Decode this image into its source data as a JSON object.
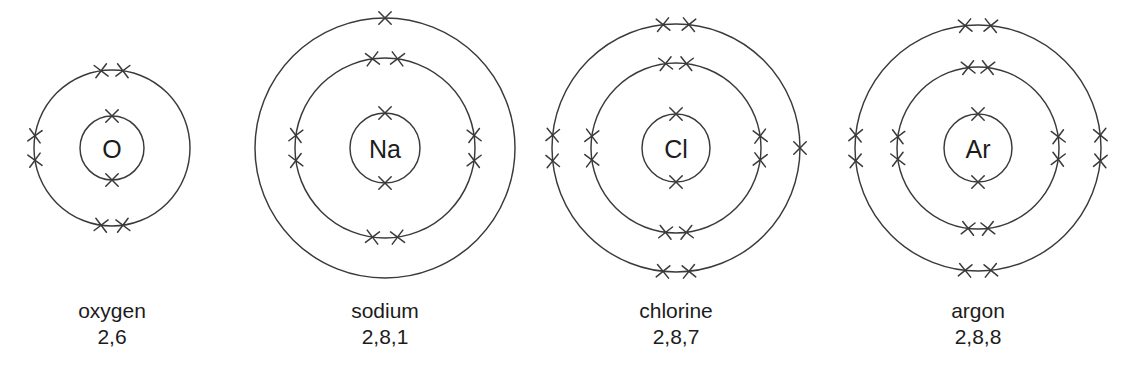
{
  "figure": {
    "background_color": "#ffffff",
    "stroke_color": "#3a3a3a",
    "text_color": "#1c1c1c",
    "electron_glyph": "x"
  },
  "chart_data": {
    "type": "diagram",
    "subtype": "bohr-electron-shell",
    "xlabel": "",
    "ylabel": "",
    "legend": [],
    "grid": false,
    "atoms": [
      {
        "symbol": "O",
        "name": "oxygen",
        "configuration": "2,6",
        "shell_counts": [
          2,
          6
        ],
        "total_electrons": 8,
        "center": [
          112,
          148
        ],
        "nucleus_radius": 32,
        "shells": [
          {
            "index": 1,
            "radius": 32,
            "electrons": 2,
            "positions": [
              {
                "angle": 90,
                "label": "top"
              },
              {
                "angle": 270,
                "label": "bottom"
              }
            ]
          },
          {
            "index": 2,
            "radius": 78,
            "electrons": 6,
            "positions": [
              {
                "angle": 82,
                "label": "top-right-of-top-pair"
              },
              {
                "angle": 98,
                "label": "top-left-of-top-pair"
              },
              {
                "angle": 171,
                "label": "upper-left-pair"
              },
              {
                "angle": 189,
                "label": "lower-left-pair"
              },
              {
                "angle": 262,
                "label": "bottom-left-of-bottom-pair"
              },
              {
                "angle": 278,
                "label": "bottom-right-of-bottom-pair"
              }
            ]
          }
        ]
      },
      {
        "symbol": "Na",
        "name": "sodium",
        "configuration": "2,8,1",
        "shell_counts": [
          2,
          8,
          1
        ],
        "total_electrons": 11,
        "center": [
          385,
          148
        ],
        "nucleus_radius": 35,
        "shells": [
          {
            "index": 1,
            "radius": 35,
            "electrons": 2,
            "positions": [
              {
                "angle": 90,
                "label": "top"
              },
              {
                "angle": 270,
                "label": "bottom"
              }
            ]
          },
          {
            "index": 2,
            "radius": 90,
            "electrons": 8,
            "positions": [
              {
                "angle": 82,
                "label": "top-pair-right"
              },
              {
                "angle": 98,
                "label": "top-pair-left"
              },
              {
                "angle": 172,
                "label": "left-pair-upper"
              },
              {
                "angle": 188,
                "label": "left-pair-lower"
              },
              {
                "angle": 262,
                "label": "bottom-pair-left"
              },
              {
                "angle": 278,
                "label": "bottom-pair-right"
              },
              {
                "angle": 8,
                "label": "right-pair-upper"
              },
              {
                "angle": 352,
                "label": "right-pair-lower"
              }
            ]
          },
          {
            "index": 3,
            "radius": 130,
            "electrons": 1,
            "positions": [
              {
                "angle": 90,
                "label": "top"
              }
            ]
          }
        ]
      },
      {
        "symbol": "Cl",
        "name": "chlorine",
        "configuration": "2,8,7",
        "shell_counts": [
          2,
          8,
          7
        ],
        "total_electrons": 17,
        "center": [
          676,
          148
        ],
        "nucleus_radius": 34,
        "shells": [
          {
            "index": 1,
            "radius": 34,
            "electrons": 2,
            "positions": [
              {
                "angle": 90,
                "label": "top"
              },
              {
                "angle": 270,
                "label": "bottom"
              }
            ]
          },
          {
            "index": 2,
            "radius": 85,
            "electrons": 8,
            "positions": [
              {
                "angle": 83,
                "label": "top-pair-right"
              },
              {
                "angle": 97,
                "label": "top-pair-left"
              },
              {
                "angle": 172,
                "label": "left-pair-upper"
              },
              {
                "angle": 188,
                "label": "left-pair-lower"
              },
              {
                "angle": 263,
                "label": "bottom-pair-left"
              },
              {
                "angle": 277,
                "label": "bottom-pair-right"
              },
              {
                "angle": 8,
                "label": "right-pair-upper"
              },
              {
                "angle": 352,
                "label": "right-pair-lower"
              }
            ]
          },
          {
            "index": 3,
            "radius": 124,
            "electrons": 7,
            "positions": [
              {
                "angle": 84,
                "label": "top-pair-right"
              },
              {
                "angle": 96,
                "label": "top-pair-left"
              },
              {
                "angle": 174,
                "label": "left-pair-upper"
              },
              {
                "angle": 186,
                "label": "left-pair-lower"
              },
              {
                "angle": 264,
                "label": "bottom-pair-left"
              },
              {
                "angle": 276,
                "label": "bottom-pair-right"
              },
              {
                "angle": 0,
                "label": "right-single-unpaired"
              }
            ]
          }
        ]
      },
      {
        "symbol": "Ar",
        "name": "argon",
        "configuration": "2,8,8",
        "shell_counts": [
          2,
          8,
          8
        ],
        "total_electrons": 18,
        "center": [
          978,
          148
        ],
        "nucleus_radius": 34,
        "shells": [
          {
            "index": 1,
            "radius": 34,
            "electrons": 2,
            "positions": [
              {
                "angle": 90,
                "label": "top"
              },
              {
                "angle": 270,
                "label": "bottom"
              }
            ]
          },
          {
            "index": 2,
            "radius": 81,
            "electrons": 8,
            "positions": [
              {
                "angle": 83,
                "label": "top-pair-right"
              },
              {
                "angle": 97,
                "label": "top-pair-left"
              },
              {
                "angle": 172,
                "label": "left-pair-upper"
              },
              {
                "angle": 188,
                "label": "left-pair-lower"
              },
              {
                "angle": 263,
                "label": "bottom-pair-left"
              },
              {
                "angle": 277,
                "label": "bottom-pair-right"
              },
              {
                "angle": 8,
                "label": "right-pair-upper"
              },
              {
                "angle": 352,
                "label": "right-pair-lower"
              }
            ]
          },
          {
            "index": 3,
            "radius": 123,
            "electrons": 8,
            "positions": [
              {
                "angle": 84,
                "label": "top-pair-right"
              },
              {
                "angle": 96,
                "label": "top-pair-left"
              },
              {
                "angle": 174,
                "label": "left-pair-upper"
              },
              {
                "angle": 186,
                "label": "left-pair-lower"
              },
              {
                "angle": 264,
                "label": "bottom-pair-left"
              },
              {
                "angle": 276,
                "label": "bottom-pair-right"
              },
              {
                "angle": 6,
                "label": "right-pair-upper"
              },
              {
                "angle": 354,
                "label": "right-pair-lower"
              }
            ]
          }
        ]
      }
    ],
    "captions": [
      {
        "name": "oxygen",
        "configuration": "2,6",
        "x": 112,
        "y": 318
      },
      {
        "name": "sodium",
        "configuration": "2,8,1",
        "x": 385,
        "y": 318
      },
      {
        "name": "chlorine",
        "configuration": "2,8,7",
        "x": 676,
        "y": 318
      },
      {
        "name": "argon",
        "configuration": "2,8,8",
        "x": 978,
        "y": 318
      }
    ]
  }
}
